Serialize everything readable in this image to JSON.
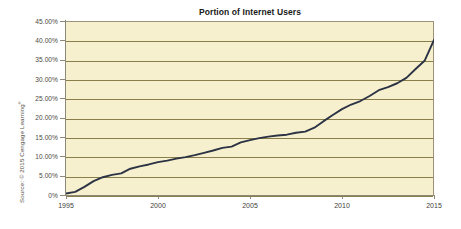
{
  "figure": {
    "title": "Portion of Internet Users",
    "source_credit_prefix": "Source: © 2015 Cengage Learning",
    "source_credit_mark": "®",
    "background_color": "#FFFFFF",
    "plot_background_color": "#F7F0CE",
    "gridline_color": "#8A7F4A",
    "axis_color": "#8E8876",
    "line_color": "#2B3344"
  },
  "chart_data": {
    "type": "line",
    "title": "Portion of Internet Users",
    "xlabel": "",
    "ylabel": "",
    "xlim": [
      1995,
      2015
    ],
    "ylim": [
      0,
      45
    ],
    "grid": true,
    "legend": "none",
    "y_tick_labels": [
      "45.00%",
      "40.00%",
      "35.00%",
      "30.00%",
      "25.00%",
      "20.00%",
      "15.00%",
      "10.00%",
      "5.00%",
      "0%"
    ],
    "y_tick_values": [
      45,
      40,
      35,
      30,
      25,
      20,
      15,
      10,
      5,
      0
    ],
    "x_tick_labels": [
      "1995",
      "2000",
      "2005",
      "2010",
      "2015"
    ],
    "x_tick_values": [
      1995,
      2000,
      2005,
      2010,
      2015
    ],
    "series": [
      {
        "name": "Portion of Internet Users",
        "color": "#2B3344",
        "x": [
          1995,
          1995.5,
          1996,
          1996.5,
          1997,
          1997.5,
          1998,
          1998.5,
          1999,
          1999.5,
          2000,
          2000.5,
          2001,
          2001.5,
          2002,
          2002.5,
          2003,
          2003.5,
          2004,
          2004.5,
          2005,
          2005.5,
          2006,
          2006.5,
          2007,
          2007.5,
          2008,
          2008.5,
          2009,
          2009.5,
          2010,
          2010.5,
          2011,
          2011.5,
          2012,
          2012.5,
          2013,
          2013.5,
          2014,
          2014.5,
          2015
        ],
        "values": [
          0.4,
          0.8,
          2.1,
          3.6,
          4.6,
          5.2,
          5.6,
          6.8,
          7.4,
          7.9,
          8.5,
          8.9,
          9.4,
          9.8,
          10.3,
          10.9,
          11.5,
          12.2,
          12.5,
          13.6,
          14.2,
          14.7,
          15.1,
          15.4,
          15.6,
          16.1,
          16.4,
          17.4,
          19.1,
          20.7,
          22.2,
          23.4,
          24.3,
          25.6,
          27.1,
          27.9,
          28.9,
          30.3,
          32.6,
          34.8,
          40.1
        ]
      }
    ]
  }
}
